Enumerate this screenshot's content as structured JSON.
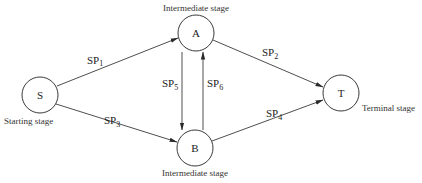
{
  "diagram": {
    "nodes": [
      {
        "id": "S",
        "label": "S",
        "caption": "Starting stage"
      },
      {
        "id": "A",
        "label": "A",
        "caption": "Intermediate stage"
      },
      {
        "id": "B",
        "label": "B",
        "caption": "Intermediate stage"
      },
      {
        "id": "T",
        "label": "T",
        "caption": "Terminal stage"
      }
    ],
    "edges": [
      {
        "from": "S",
        "to": "A",
        "label": "SP",
        "sub": "1"
      },
      {
        "from": "A",
        "to": "T",
        "label": "SP",
        "sub": "2"
      },
      {
        "from": "S",
        "to": "B",
        "label": "SP",
        "sub": "3"
      },
      {
        "from": "B",
        "to": "T",
        "label": "SP",
        "sub": "4"
      },
      {
        "from": "A",
        "to": "B",
        "label": "SP",
        "sub": "5"
      },
      {
        "from": "B",
        "to": "A",
        "label": "SP",
        "sub": "6"
      }
    ]
  }
}
